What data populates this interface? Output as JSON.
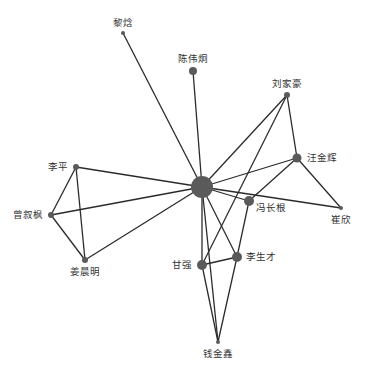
{
  "diagram": {
    "type": "network",
    "colors": {
      "edge": "#2b2b2b",
      "node": "#5a5a5a",
      "label": "#333333",
      "background": "#ffffff"
    },
    "nodes": [
      {
        "id": "hub",
        "label": "",
        "x": 202,
        "y": 187,
        "r": 11,
        "label_dx": 0,
        "label_dy": 0,
        "anchor": "middle"
      },
      {
        "id": "lihan",
        "label": "黎焓",
        "x": 123,
        "y": 33,
        "r": 2,
        "label_dx": 0,
        "label_dy": -7,
        "anchor": "middle"
      },
      {
        "id": "chenweijiong",
        "label": "陈伟炯",
        "x": 193,
        "y": 71,
        "r": 4,
        "label_dx": 0,
        "label_dy": -9,
        "anchor": "middle"
      },
      {
        "id": "liujiahao",
        "label": "刘家豪",
        "x": 287,
        "y": 95,
        "r": 3,
        "label_dx": 0,
        "label_dy": -8,
        "anchor": "middle"
      },
      {
        "id": "wangjinhui",
        "label": "汪金辉",
        "x": 297,
        "y": 158,
        "r": 4.5,
        "label_dx": 10,
        "label_dy": 3,
        "anchor": "start"
      },
      {
        "id": "liping",
        "label": "李平",
        "x": 76,
        "y": 167,
        "r": 3,
        "label_dx": -8,
        "label_dy": 3,
        "anchor": "end"
      },
      {
        "id": "zengxufeng",
        "label": "曾叙枫",
        "x": 51,
        "y": 215,
        "r": 3,
        "label_dx": -8,
        "label_dy": 3,
        "anchor": "end"
      },
      {
        "id": "fengchanggen",
        "label": "冯长根",
        "x": 249,
        "y": 201,
        "r": 5,
        "label_dx": 7,
        "label_dy": 10,
        "anchor": "start"
      },
      {
        "id": "cuixin",
        "label": "崔欣",
        "x": 341,
        "y": 208,
        "r": 2,
        "label_dx": 0,
        "label_dy": 15,
        "anchor": "middle"
      },
      {
        "id": "jiangchenming",
        "label": "姜晨明",
        "x": 85,
        "y": 260,
        "r": 3,
        "label_dx": 0,
        "label_dy": 15,
        "anchor": "middle"
      },
      {
        "id": "ganqiang",
        "label": "甘强",
        "x": 202,
        "y": 265,
        "r": 5,
        "label_dx": -10,
        "label_dy": 3,
        "anchor": "end"
      },
      {
        "id": "lishengcai",
        "label": "李生才",
        "x": 237,
        "y": 257,
        "r": 5,
        "label_dx": 9,
        "label_dy": 3,
        "anchor": "start"
      },
      {
        "id": "qianjinxin",
        "label": "钱金鑫",
        "x": 218,
        "y": 342,
        "r": 2,
        "label_dx": 0,
        "label_dy": 15,
        "anchor": "middle"
      }
    ],
    "edges": [
      [
        "hub",
        "lihan"
      ],
      [
        "hub",
        "chenweijiong"
      ],
      [
        "hub",
        "liujiahao"
      ],
      [
        "hub",
        "wangjinhui"
      ],
      [
        "hub",
        "liping"
      ],
      [
        "hub",
        "zengxufeng"
      ],
      [
        "hub",
        "jiangchenming"
      ],
      [
        "hub",
        "fengchanggen"
      ],
      [
        "hub",
        "cuixin"
      ],
      [
        "hub",
        "ganqiang"
      ],
      [
        "hub",
        "lishengcai"
      ],
      [
        "hub",
        "qianjinxin"
      ],
      [
        "liujiahao",
        "wangjinhui"
      ],
      [
        "liujiahao",
        "ganqiang"
      ],
      [
        "wangjinhui",
        "fengchanggen"
      ],
      [
        "wangjinhui",
        "cuixin"
      ],
      [
        "fengchanggen",
        "lishengcai"
      ],
      [
        "liping",
        "zengxufeng"
      ],
      [
        "liping",
        "jiangchenming"
      ],
      [
        "zengxufeng",
        "jiangchenming"
      ],
      [
        "ganqiang",
        "lishengcai"
      ],
      [
        "ganqiang",
        "qianjinxin"
      ],
      [
        "lishengcai",
        "qianjinxin"
      ]
    ]
  }
}
